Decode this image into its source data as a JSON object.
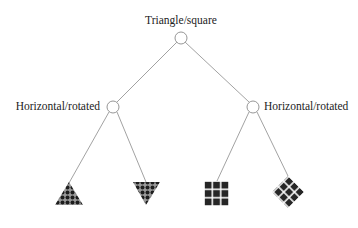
{
  "diagram": {
    "type": "decision-tree",
    "root": {
      "label": "Triangle/square"
    },
    "branches": [
      {
        "label": "Horizontal/rotated",
        "leaves": [
          {
            "shape": "triangle-up",
            "pattern": "dotted-grid"
          },
          {
            "shape": "triangle-down",
            "pattern": "dotted-grid"
          }
        ]
      },
      {
        "label": "Horizontal/rotated",
        "leaves": [
          {
            "shape": "square",
            "pattern": "white-grid"
          },
          {
            "shape": "diamond",
            "pattern": "white-grid"
          }
        ]
      }
    ],
    "colors": {
      "line": "#888888",
      "node_stroke": "#888888",
      "node_fill": "#ffffff",
      "shape_fill": "#2a2a2a",
      "text": "#222222"
    }
  }
}
